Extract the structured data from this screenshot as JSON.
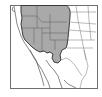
{
  "map": {
    "title": "",
    "region": "Western North America",
    "colors": {
      "background": "#ffffff",
      "frame": "#6e6e6e",
      "land_outline": "#555555",
      "state_lines": "#8a8a8a",
      "range_fill": "#a9a9a9",
      "range_outline": "#3a3a3a"
    },
    "legend": [],
    "shaded_range": "Western US interior (Pacific Northwest through Great Basin, Rockies, and into west Texas)"
  }
}
